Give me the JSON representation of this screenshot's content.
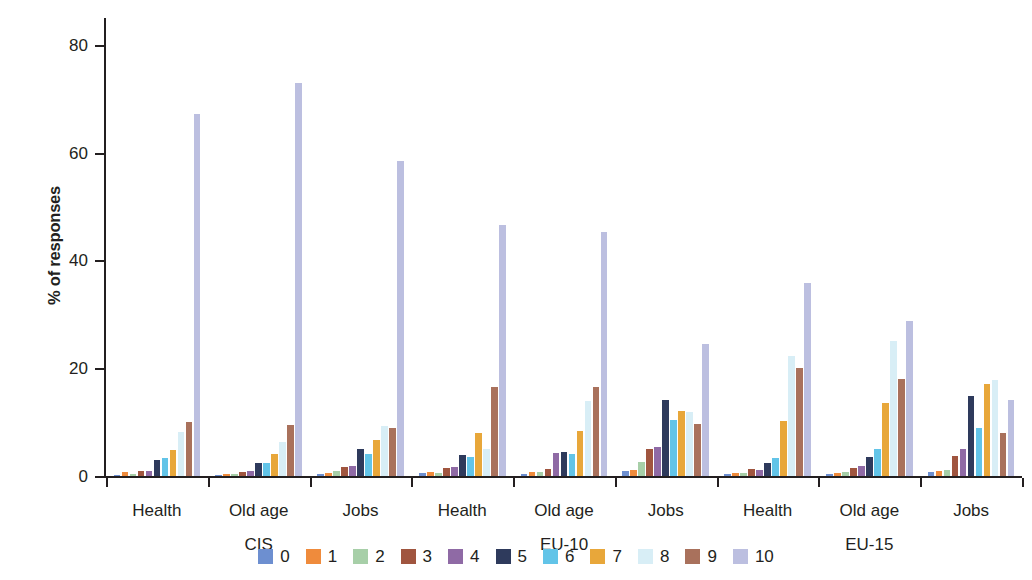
{
  "chart_data": {
    "type": "bar",
    "title": "",
    "subtitle": "",
    "xlabel": "",
    "ylabel": "% of responses",
    "ylim": [
      0,
      85
    ],
    "yticks": [
      0,
      20,
      40,
      60,
      80
    ],
    "ytick_labels": [
      "0",
      "20",
      "40",
      "60",
      "80"
    ],
    "grid": false,
    "legend_position": "bottom",
    "legend_title": "",
    "group_labels": [
      "CIS",
      "EU-10",
      "EU-15"
    ],
    "categories": [
      "Health",
      "Old age",
      "Jobs",
      "Health",
      "Old age",
      "Jobs",
      "Health",
      "Old age",
      "Jobs"
    ],
    "category_groups": [
      {
        "group": "CIS",
        "categories": [
          "Health",
          "Old age",
          "Jobs"
        ]
      },
      {
        "group": "EU-10",
        "categories": [
          "Health",
          "Old age",
          "Jobs"
        ]
      },
      {
        "group": "EU-15",
        "categories": [
          "Health",
          "Old age",
          "Jobs"
        ]
      }
    ],
    "series": [
      {
        "name": "0",
        "color": "#6d8fd0",
        "values": [
          0.2,
          0.2,
          0.3,
          0.5,
          0.3,
          1.0,
          0.4,
          0.3,
          0.7
        ]
      },
      {
        "name": "1",
        "color": "#ef8b3c",
        "values": [
          0.7,
          0.4,
          0.6,
          0.8,
          0.7,
          1.2,
          0.6,
          0.6,
          1.0
        ]
      },
      {
        "name": "2",
        "color": "#a7cfa8",
        "values": [
          0.3,
          0.3,
          1.0,
          0.6,
          0.8,
          2.6,
          0.5,
          0.7,
          1.2
        ]
      },
      {
        "name": "3",
        "color": "#a0553f",
        "values": [
          1.0,
          0.8,
          1.6,
          1.4,
          1.3,
          5.0,
          1.3,
          1.5,
          3.7
        ]
      },
      {
        "name": "4",
        "color": "#8f6aa5",
        "values": [
          1.0,
          1.0,
          1.9,
          1.6,
          4.3,
          5.4,
          1.2,
          1.8,
          5.0
        ]
      },
      {
        "name": "5",
        "color": "#2e3a5c",
        "values": [
          3.0,
          2.5,
          5.0,
          3.9,
          4.5,
          14.2,
          2.4,
          3.6,
          14.9
        ]
      },
      {
        "name": "6",
        "color": "#62c4e8",
        "values": [
          3.3,
          2.4,
          4.1,
          3.6,
          4.0,
          10.4,
          3.3,
          5.0,
          9.0
        ]
      },
      {
        "name": "7",
        "color": "#e8a73a",
        "values": [
          4.9,
          4.1,
          6.6,
          7.9,
          8.4,
          12.0,
          10.2,
          13.5,
          17.0
        ]
      },
      {
        "name": "8",
        "color": "#d8eef6",
        "values": [
          8.1,
          6.3,
          9.3,
          5.1,
          14.0,
          11.9,
          22.3,
          25.0,
          17.8
        ]
      },
      {
        "name": "9",
        "color": "#a9715c",
        "values": [
          10.1,
          9.4,
          8.9,
          16.5,
          16.6,
          9.6,
          20.0,
          18.0,
          8.0
        ]
      },
      {
        "name": "10",
        "color": "#bcbfe0",
        "values": [
          67.2,
          73.0,
          58.4,
          46.5,
          45.2,
          24.5,
          35.8,
          28.8,
          14.1
        ]
      }
    ]
  }
}
